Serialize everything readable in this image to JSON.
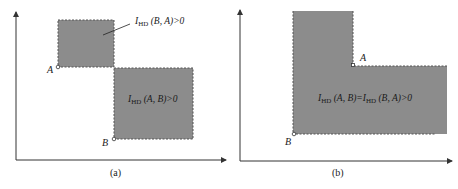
{
  "colors": {
    "fill": "#8c8c8c",
    "axis": "#333333",
    "dash": "#555555"
  },
  "panel_a": {
    "caption": "(a)",
    "point_a_label": "A",
    "point_b_label": "B",
    "upper_label_prefix": "I",
    "upper_label_sub": "HD",
    "upper_label_rest": "(B, A)>0",
    "lower_label_prefix": "I",
    "lower_label_sub": "HD",
    "lower_label_rest": "(A, B)>0"
  },
  "panel_b": {
    "caption": "(b)",
    "point_a_label": "A",
    "point_b_label": "B",
    "eq_p1": "I",
    "eq_sub1": "HD",
    "eq_p2": "(A, B)=",
    "eq_p3": "I",
    "eq_sub2": "HD",
    "eq_p4": "(B, A)>0"
  }
}
